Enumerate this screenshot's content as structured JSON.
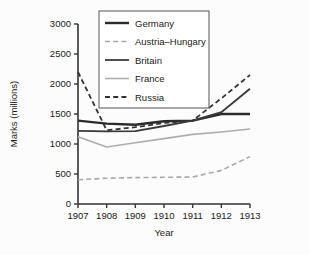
{
  "chart_data": {
    "type": "line",
    "title": "",
    "xlabel": "Year",
    "ylabel": "Marks (millions)",
    "x": [
      1907,
      1908,
      1909,
      1910,
      1911,
      1912,
      1913
    ],
    "xlim": [
      1907,
      1913
    ],
    "ylim": [
      0,
      3000
    ],
    "yticks": [
      0,
      500,
      1000,
      1500,
      2000,
      2500,
      3000
    ],
    "xticks": [
      "1907",
      "1908",
      "1909",
      "1910",
      "1911",
      "1912",
      "1913"
    ],
    "ytick_labels": [
      "0",
      "500",
      "1000",
      "1500",
      "2000",
      "2500",
      "3000"
    ],
    "grid": false,
    "legend_position": "top-center",
    "series": [
      {
        "name": "Germany",
        "values": [
          1390,
          1340,
          1320,
          1380,
          1390,
          1500,
          1500
        ],
        "color": "#2b2b2b",
        "style": "solid",
        "width": 2.4
      },
      {
        "name": "Austria–Hungary",
        "values": [
          405,
          430,
          440,
          445,
          450,
          560,
          790
        ],
        "color": "#a8a8a8",
        "style": "dashed",
        "width": 1.6
      },
      {
        "name": "Britain",
        "values": [
          1220,
          1210,
          1215,
          1300,
          1390,
          1530,
          1920
        ],
        "color": "#3a3a3a",
        "style": "solid",
        "width": 1.8
      },
      {
        "name": "France",
        "values": [
          1120,
          950,
          1020,
          1090,
          1160,
          1200,
          1250
        ],
        "color": "#adadad",
        "style": "solid",
        "width": 1.6
      },
      {
        "name": "Russia",
        "values": [
          2200,
          1230,
          1280,
          1350,
          1390,
          1760,
          2150
        ],
        "color": "#333333",
        "style": "dashed",
        "width": 1.8
      }
    ]
  },
  "legend": {
    "items": [
      "Germany",
      "Austria–Hungary",
      "Britain",
      "France",
      "Russia"
    ]
  },
  "colors": {
    "axis": "#333333",
    "background": "#fcfcfc",
    "legend_border": "#555555",
    "legend_background": "#ffffff"
  }
}
